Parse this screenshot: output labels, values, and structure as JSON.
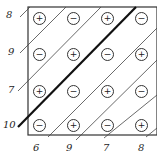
{
  "diagram": {
    "grid": [
      [
        "+",
        "−",
        "+",
        "−"
      ],
      [
        "−",
        "+",
        "−",
        "+"
      ],
      [
        "+",
        "−",
        "+",
        "−"
      ],
      [
        "−",
        "+",
        "−",
        "+"
      ]
    ],
    "left_labels": [
      "8",
      "9",
      "7",
      "10"
    ],
    "bottom_labels": [
      "6",
      "9",
      "7",
      "8"
    ],
    "bold_line_label": "10"
  }
}
